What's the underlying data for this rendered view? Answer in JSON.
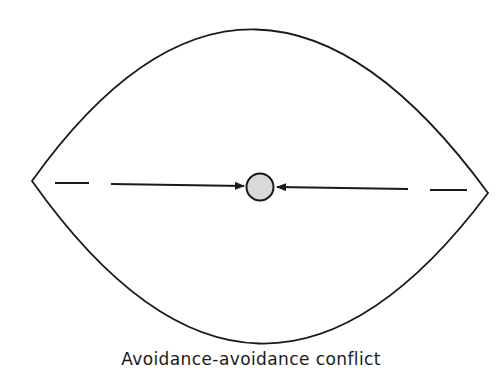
{
  "figure": {
    "caption": "Avoidance-avoidance conflict",
    "colors": {
      "stroke": "#1a1a1a",
      "circle_fill": "#d9d9d9",
      "background": "#ffffff"
    },
    "region": {
      "shape": "lens",
      "left_apex": [
        32,
        181
      ],
      "right_apex": [
        488,
        193
      ],
      "top": [
        253,
        27
      ],
      "bottom": [
        258,
        348
      ]
    },
    "person": {
      "shape": "circle",
      "center": [
        260,
        187
      ],
      "radius": 14
    },
    "forces": [
      {
        "name": "left-avoidance-force",
        "dash": [
          [
            55,
            183
          ],
          [
            89,
            183
          ]
        ],
        "arrow": [
          [
            111,
            184
          ],
          [
            242,
            186
          ]
        ],
        "direction": "right"
      },
      {
        "name": "right-avoidance-force",
        "dash": [
          [
            430,
            190
          ],
          [
            467,
            190
          ]
        ],
        "arrow": [
          [
            408,
            189
          ],
          [
            281,
            187
          ]
        ],
        "direction": "left"
      }
    ]
  }
}
